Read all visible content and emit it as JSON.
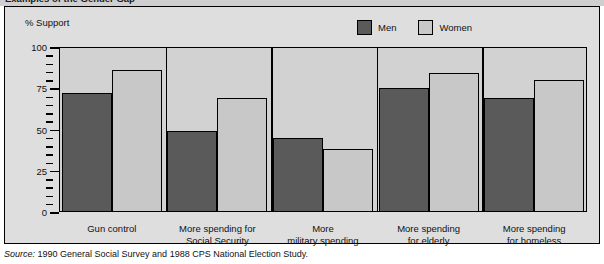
{
  "figure": {
    "title": "Examples of the Gender Gap",
    "axis_title": "% Support",
    "source_label": "Source:",
    "source_text": "1990 General Social Survey and 1988 CPS National Election Study."
  },
  "legend": {
    "position": "top-right",
    "items": [
      {
        "label": "Men",
        "color": "#5a5a5a",
        "swatch_name": "legend-swatch-men"
      },
      {
        "label": "Women",
        "color": "#c8c8c8",
        "swatch_name": "legend-swatch-women"
      }
    ]
  },
  "chart_data": {
    "type": "bar",
    "title": "Examples of the Gender Gap",
    "subtitle": "",
    "xlabel": "",
    "ylabel": "% Support",
    "ylim": [
      0,
      100
    ],
    "yticks": [
      0,
      25,
      50,
      75,
      100
    ],
    "ytick_labels": [
      "0",
      "25",
      "50",
      "75",
      "100"
    ],
    "minor_tick_step": 5,
    "grid": false,
    "legend_position": "top-right",
    "categories": [
      "Gun control",
      "More spending for Social Security",
      "More military spending",
      "More spending for elderly",
      "More spending for homeless"
    ],
    "category_lines": [
      [
        "Gun control"
      ],
      [
        "More spending for",
        "Social Security"
      ],
      [
        "More",
        "military spending"
      ],
      [
        "More spending",
        "for elderly"
      ],
      [
        "More spending",
        "for homeless"
      ]
    ],
    "series": [
      {
        "name": "Men",
        "color": "#5a5a5a",
        "values": [
          72,
          49,
          45,
          75,
          69
        ]
      },
      {
        "name": "Women",
        "color": "#c8c8c8",
        "values": [
          86,
          69,
          38,
          84,
          80
        ]
      }
    ]
  }
}
